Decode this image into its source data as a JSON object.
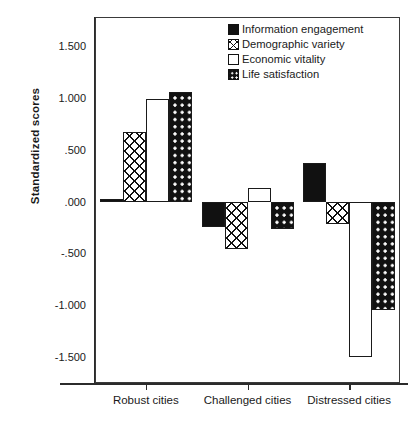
{
  "chart_data": {
    "type": "bar",
    "title": "",
    "subtitle": "",
    "xlabel": "",
    "ylabel": "Standardized scores",
    "categories": [
      "Robust cities",
      "Challenged cities",
      "Distressed cities"
    ],
    "series": [
      {
        "name": "Information engagement",
        "pattern": "solid",
        "values": [
          0.02,
          -0.25,
          0.37
        ]
      },
      {
        "name": "Demographic variety",
        "pattern": "crosshatch",
        "values": [
          0.67,
          -0.46,
          -0.22
        ]
      },
      {
        "name": "Economic vitality",
        "pattern": "empty",
        "values": [
          0.99,
          0.13,
          -1.5
        ]
      },
      {
        "name": "Life satisfaction",
        "pattern": "dotgrid",
        "values": [
          1.06,
          -0.26,
          -1.05
        ]
      }
    ],
    "ylim": [
      -1.75,
      1.78
    ],
    "yticks": [
      1.5,
      1.0,
      0.5,
      0.0,
      -0.5,
      -1.0,
      -1.5
    ],
    "ytick_labels": [
      "1.500",
      "1.000",
      ".500",
      ".000",
      "-.500",
      "-1.000",
      "-1.500"
    ],
    "grid": false,
    "legend_position": "top-right",
    "baseline": 0.0
  },
  "legend": {
    "items": [
      {
        "label": "Information engagement",
        "pattern": "solid"
      },
      {
        "label": "Demographic variety",
        "pattern": "crosshatch"
      },
      {
        "label": "Economic vitality",
        "pattern": "empty"
      },
      {
        "label": "Life satisfaction",
        "pattern": "dotgrid"
      }
    ]
  },
  "colors": {
    "ink": "#111111",
    "frame": "#3a3a3a",
    "background": "#ffffff"
  }
}
